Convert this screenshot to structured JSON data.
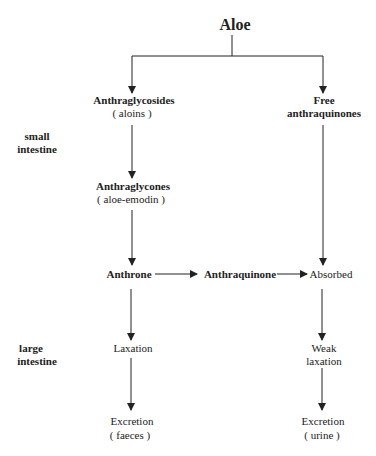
{
  "title": "Aloe",
  "nodes": {
    "anthraglycosides": {
      "name": "Anthraglycosides",
      "sub": "( aloins )"
    },
    "free_anthraquinones": {
      "line1": "Free",
      "line2": "anthraquinones"
    },
    "anthraglycones": {
      "name": "Anthraglycones",
      "sub": "( aloe-emodin )"
    },
    "anthrone": {
      "name": "Anthrone"
    },
    "anthraquinone": {
      "name": "Anthraquinone"
    },
    "absorbed": {
      "name": "Absorbed"
    },
    "laxation": {
      "name": "Laxation"
    },
    "weak_laxation": {
      "line1": "Weak",
      "line2": "laxation"
    },
    "excretion_faeces": {
      "name": "Excretion",
      "sub": "( faeces )"
    },
    "excretion_urine": {
      "name": "Excretion",
      "sub": "( urine )"
    }
  },
  "regions": {
    "small_intestine": {
      "line1": "small",
      "line2": "intestine"
    },
    "large_intestine": {
      "line1": "large",
      "line2": "intestine"
    }
  }
}
